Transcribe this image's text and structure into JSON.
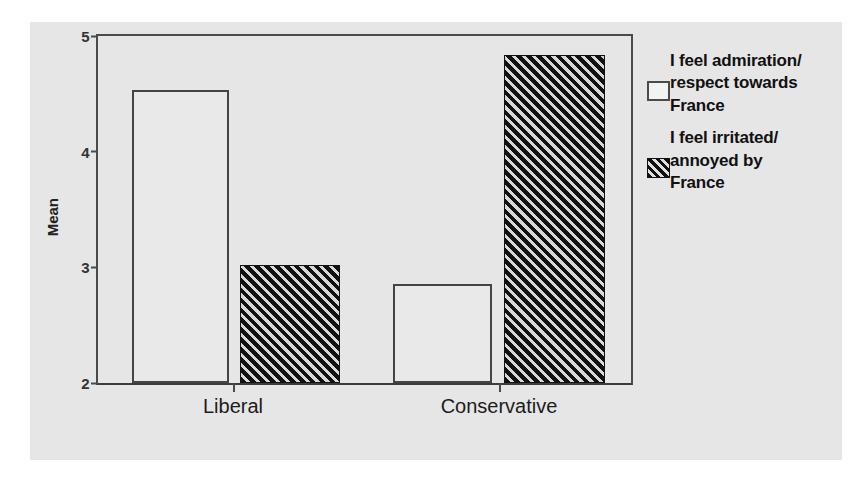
{
  "chart_data": {
    "type": "bar",
    "title": "",
    "xlabel": "",
    "ylabel": "Mean",
    "ylim": [
      2,
      5
    ],
    "yticks": [
      2,
      3,
      4,
      5
    ],
    "ytick_labels": [
      "2",
      "3",
      "4",
      "5"
    ],
    "grid": false,
    "legend_position": "right",
    "categories": [
      "Liberal",
      "Conservative"
    ],
    "series": [
      {
        "name": "I feel admiration/respect towards France",
        "name_lines": [
          "I feel admiration/",
          "respect towards",
          "France"
        ],
        "pattern": "open",
        "values": [
          4.53,
          2.86
        ]
      },
      {
        "name": "I feel irritated/annoyed by France",
        "name_lines": [
          "I feel irritated/",
          "annoyed by",
          "France"
        ],
        "pattern": "hatched",
        "values": [
          3.02,
          4.84
        ]
      }
    ]
  },
  "colors": {
    "figure_background": "#e6e6e6",
    "page_background": "#ffffff",
    "axis": "#4a4a4a",
    "bar_open_fill": "#e9e9e9",
    "bar_hatch_dark": "#111111",
    "text": "#111111"
  }
}
